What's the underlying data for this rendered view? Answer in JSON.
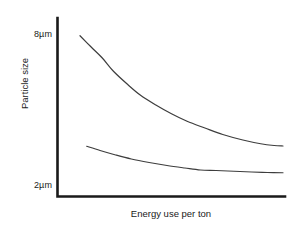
{
  "chart_data": {
    "type": "line",
    "title": "",
    "xlabel": "Energy use per ton",
    "ylabel": "Particle size",
    "ytick_labels": [
      "8µm",
      "2µm"
    ],
    "ytick_values": [
      8,
      2
    ],
    "xtick_labels": [],
    "grid": false,
    "legend": null,
    "axis_style": "L-shaped (left and bottom spines only)",
    "ylim": [
      2,
      8
    ],
    "yunit": "µm",
    "x_axis_note": "unlabeled, increasing energy use to the right",
    "series": [
      {
        "name": "upper curve",
        "color": "#3d3d3d",
        "x": [
          0.09,
          0.14,
          0.19,
          0.24,
          0.3,
          0.36,
          0.43,
          0.5,
          0.57,
          0.65,
          0.73,
          0.82,
          0.9,
          0.96,
          1.0
        ],
        "values": [
          7.97,
          7.52,
          7.08,
          6.55,
          6.05,
          5.6,
          5.2,
          4.85,
          4.55,
          4.28,
          4.02,
          3.8,
          3.65,
          3.58,
          3.56
        ]
      },
      {
        "name": "lower curve",
        "color": "#3d3d3d",
        "x": [
          0.12,
          0.18,
          0.25,
          0.32,
          0.4,
          0.48,
          0.56,
          0.63,
          0.7,
          0.78,
          0.86,
          0.93,
          1.0
        ],
        "values": [
          3.55,
          3.38,
          3.2,
          3.04,
          2.9,
          2.78,
          2.68,
          2.6,
          2.58,
          2.55,
          2.52,
          2.5,
          2.49
        ]
      }
    ]
  },
  "figure": {
    "background_color": "#ffffff",
    "axis_color": "#1a1a1a",
    "line_color": "#3d3d3d"
  }
}
